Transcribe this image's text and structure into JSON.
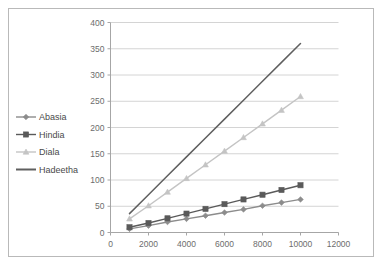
{
  "chart_data": {
    "type": "line",
    "title": "",
    "xlabel": "",
    "ylabel": "",
    "xlim": [
      0,
      12000
    ],
    "ylim": [
      0,
      400
    ],
    "xticks": [
      0,
      2000,
      4000,
      6000,
      8000,
      10000,
      12000
    ],
    "yticks": [
      0,
      50,
      100,
      150,
      200,
      250,
      300,
      350,
      400
    ],
    "grid": "horizontal",
    "legend_position": "left-outside",
    "x": [
      1000,
      2000,
      3000,
      4000,
      5000,
      6000,
      7000,
      8000,
      9000,
      10000
    ],
    "series": [
      {
        "name": "Abasia",
        "color": "#8c8c8c",
        "marker": "diamond",
        "values": [
          7,
          13,
          20,
          26,
          32,
          38,
          44,
          51,
          57,
          63
        ]
      },
      {
        "name": "Hindia",
        "color": "#5a5a5a",
        "marker": "square",
        "values": [
          10,
          18,
          27,
          36,
          45,
          54,
          63,
          72,
          81,
          90
        ]
      },
      {
        "name": "Diala",
        "color": "#c4c4c4",
        "marker": "triangle",
        "values": [
          26,
          51,
          77,
          103,
          129,
          155,
          181,
          207,
          233,
          259
        ]
      },
      {
        "name": "Hadeetha",
        "color": "#5f5f5f",
        "marker": "none",
        "values": [
          36,
          72,
          108,
          144,
          180,
          216,
          252,
          288,
          324,
          360
        ]
      }
    ]
  },
  "axis": {
    "y_tick_labels": [
      "400",
      "350",
      "300",
      "250",
      "200",
      "150",
      "100",
      "50",
      "0"
    ],
    "x_tick_labels": [
      "0",
      "2000",
      "4000",
      "6000",
      "8000",
      "10000",
      "12000"
    ]
  },
  "legend": {
    "items": [
      {
        "label": "Abasia"
      },
      {
        "label": "Hindia"
      },
      {
        "label": "Diala"
      },
      {
        "label": "Hadeetha"
      }
    ]
  },
  "colors": {
    "frame_border": "#b9b9b9",
    "gridline": "#d4d4d4",
    "axis_line": "#a6a6a6",
    "tick_text": "#6d6d6d",
    "legend_text": "#4a4a4a",
    "background": "#ffffff"
  }
}
